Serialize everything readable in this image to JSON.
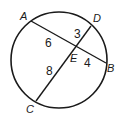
{
  "diagram": {
    "type": "circle-intersecting-chords",
    "circle": {
      "cx": 59,
      "cy": 60,
      "r": 48
    },
    "points": {
      "A": {
        "label": "A",
        "x": 31,
        "y": 21
      },
      "B": {
        "label": "B",
        "x": 106,
        "y": 63
      },
      "C": {
        "label": "C",
        "x": 36,
        "y": 101
      },
      "D": {
        "label": "D",
        "x": 91,
        "y": 26
      },
      "E": {
        "label": "E",
        "x": 76,
        "y": 49
      }
    },
    "chords": [
      {
        "name": "AB",
        "from": "A",
        "to": "B"
      },
      {
        "name": "CD",
        "from": "C",
        "to": "D"
      }
    ],
    "segments": {
      "AE": {
        "label": "6"
      },
      "DE": {
        "label": "3"
      },
      "EB": {
        "label": "4"
      },
      "CE": {
        "label": "8"
      }
    },
    "stroke_color": "#1a1a1a"
  }
}
